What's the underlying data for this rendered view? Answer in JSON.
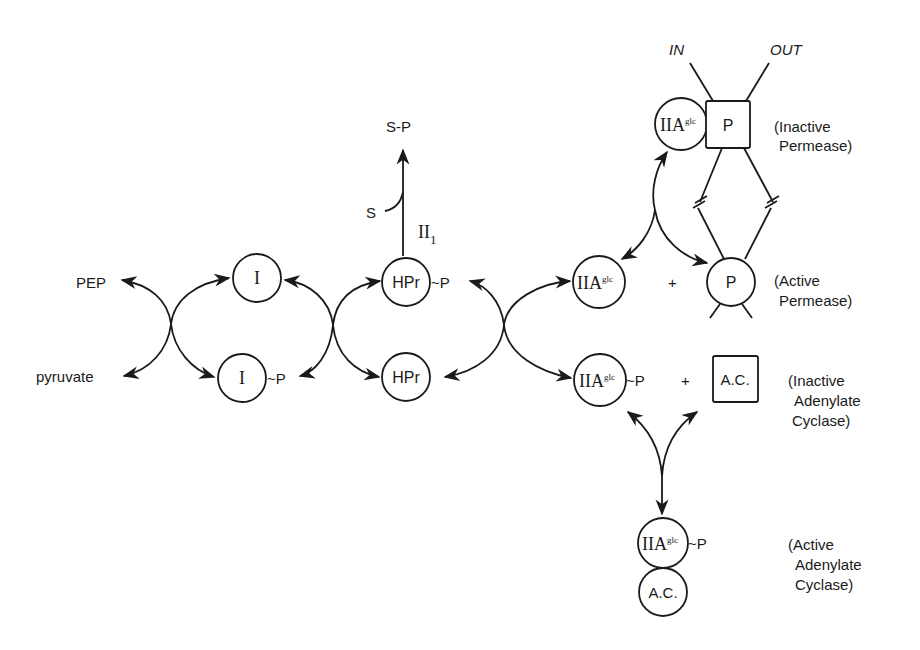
{
  "diagram": {
    "substrates": {
      "pep": "PEP",
      "pyruvate": "pyruvate",
      "s": "S",
      "sp": "S-P"
    },
    "enzymes": {
      "i": "I",
      "i_p_suffix": "~P",
      "hpr": "HPr",
      "hpr_p_suffix": "~P",
      "enzyme_ii_base": "II",
      "enzyme_ii_sub": "1",
      "iia_base": "IIA",
      "iia_sup": "glc",
      "iia_p_suffix": "~P",
      "permease": "P",
      "adenylate_cyclase": "A.C.",
      "plus": "+"
    },
    "membrane": {
      "in": "IN",
      "out": "OUT"
    },
    "state_labels": {
      "inactive_permease": [
        "(Inactive",
        "Permease)"
      ],
      "active_permease": [
        "(Active",
        "Permease)"
      ],
      "inactive_ac": [
        "(Inactive",
        "Adenylate",
        "Cyclase)"
      ],
      "active_ac": [
        "(Active",
        "Adenylate",
        "Cyclase)"
      ]
    },
    "colors": {
      "ink": "#1a1a1a",
      "background": "#ffffff"
    }
  }
}
